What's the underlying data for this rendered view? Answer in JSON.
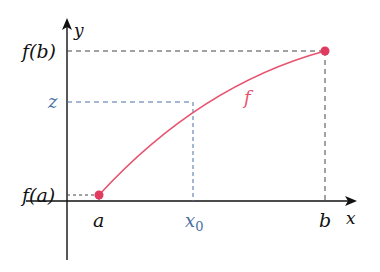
{
  "diagram": {
    "type": "intermediate-value-theorem",
    "axes": {
      "x_label": "x",
      "y_label": "y"
    },
    "function_label": "f",
    "points": {
      "a": {
        "x_label": "a",
        "y_label": "f(a)"
      },
      "b": {
        "x_label": "b",
        "y_label": "f(b)"
      },
      "x0": {
        "x_label": "x",
        "x_sub": "0",
        "y_label": "z"
      }
    },
    "colors": {
      "curve": "#e8546f",
      "point": "#e03a5e",
      "highlight": "#4a6fa5",
      "axis": "#111111",
      "dashed": "#444444"
    }
  }
}
